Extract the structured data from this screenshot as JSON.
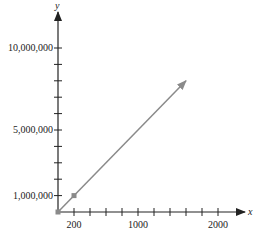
{
  "chart_data": {
    "type": "line",
    "title": "",
    "xlabel": "x",
    "ylabel": "y",
    "x_ticks": [
      200,
      1000,
      2000
    ],
    "y_ticks": [
      1000000,
      5000000,
      10000000
    ],
    "x_tick_labels": [
      "200",
      "1000",
      "2000"
    ],
    "y_tick_labels": [
      "1,000,000",
      "5,000,000",
      "10,000,000"
    ],
    "x_minor_tick_step": 200,
    "y_minor_tick_step": 1000000,
    "xlim": [
      0,
      2300
    ],
    "ylim": [
      0,
      12000000
    ],
    "series": [
      {
        "name": "y = 5000x",
        "x": [
          0,
          1600
        ],
        "values": [
          0,
          8000000
        ],
        "color": "#8a8a8a",
        "arrow_end": true
      }
    ],
    "points": [
      {
        "x": 0,
        "y": 0,
        "color": "#8a8a8a"
      },
      {
        "x": 200,
        "y": 1000000,
        "color": "#8a8a8a"
      }
    ],
    "grid": false,
    "legend": null
  },
  "colors": {
    "axis": "#222222",
    "line": "#8a8a8a"
  }
}
